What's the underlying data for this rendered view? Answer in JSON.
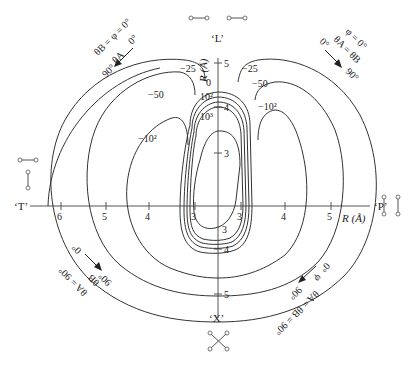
{
  "diagram": {
    "type": "polar potential-energy contour map",
    "axes": {
      "top_label": "‘L’",
      "left_label": "‘T’",
      "right_label": "‘P’",
      "bottom_label": "‘X’",
      "vertical_axis_title": "R (Å)",
      "horizontal_axis_title": "R (Å)",
      "horizontal_ticks": [
        "6",
        "5",
        "4",
        "3",
        "3",
        "4",
        "5"
      ],
      "vertical_ticks_upper": [
        "5",
        "4",
        "3"
      ],
      "vertical_ticks_lower": [
        "3",
        "4",
        "5"
      ]
    },
    "contour_labels": {
      "left_outer": "−25",
      "left_mid": "−50",
      "left_inner": "−10²",
      "right_outer": "−25",
      "right_mid": "−50",
      "right_inner": "−10²",
      "center_zero": "0",
      "center_100": "10²",
      "center_1000": "10³"
    },
    "angle_annotations": {
      "top_left": {
        "condition": "θB = φ = 0°",
        "variable": "θA",
        "from": "0°",
        "to": "90°"
      },
      "top_right": {
        "condition": "φ = 0°",
        "variable": "θA = θB",
        "from": "0°",
        "to": "90°"
      },
      "bottom_left": {
        "condition": "θA = 90°",
        "variable": "θB",
        "from": "0°",
        "to": "90°"
      },
      "bottom_right": {
        "condition": "θA = θB = 90°",
        "variable": "φ",
        "from": "0°",
        "to": "90°"
      }
    },
    "geometries": {
      "L": "two parallel-in-line molecules (linear)",
      "T": "T-shaped",
      "P": "parallel",
      "X": "crossed"
    }
  }
}
